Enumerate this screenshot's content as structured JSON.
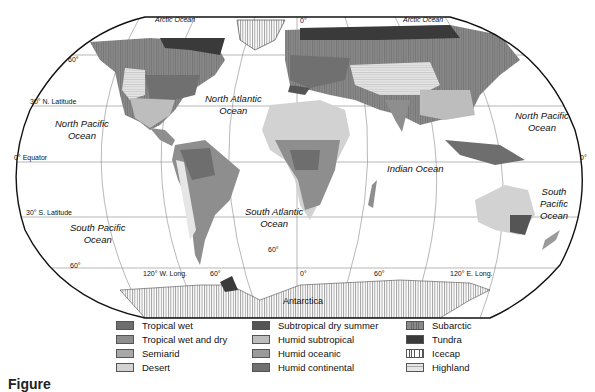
{
  "map": {
    "title": "World climate regions",
    "oceans": [
      {
        "name": "Arctic Ocean",
        "key": "arctic_w"
      },
      {
        "name": "Arctic Ocean",
        "key": "arctic_e"
      },
      {
        "line1": "North Pacific",
        "line2": "Ocean",
        "key": "npac_w"
      },
      {
        "line1": "North Atlantic",
        "line2": "Ocean",
        "key": "natl"
      },
      {
        "line1": "North Pacific",
        "line2": "Ocean",
        "key": "npac_e"
      },
      {
        "name": "Indian Ocean",
        "key": "indian"
      },
      {
        "line1": "South Atlantic",
        "line2": "Ocean",
        "key": "satl"
      },
      {
        "line1": "South Pacific",
        "line2": "Ocean",
        "key": "spac_w"
      },
      {
        "line1": "South",
        "line2": "Pacific",
        "line3": "Ocean",
        "key": "spac_e"
      }
    ],
    "continent_labels": {
      "antarctica": "Antarctica"
    },
    "graticule_labels": {
      "lat_60_n": "60°",
      "lat_30_n": "30° N. Latitude",
      "equator": "0° Equator",
      "equator_right": "0°",
      "lat_30_s": "30° S. Latitude",
      "lat_60_s": "60°",
      "lat_60_s_mid": "60°",
      "lon_0_top": "0°",
      "lon_120w": "120° W. Long.",
      "lon_60w": "60°",
      "lon_0": "0°",
      "lon_60e": "60°",
      "lon_120e": "120° E. Long."
    }
  },
  "legend": {
    "columns": [
      [
        {
          "label": "Tropical wet",
          "color": "#6e6e6e",
          "pattern": "solid"
        },
        {
          "label": "Tropical wet and dry",
          "color": "#8e8e8e",
          "pattern": "solid"
        },
        {
          "label": "Semiarid",
          "color": "#a8a8a8",
          "pattern": "dots"
        },
        {
          "label": "Desert",
          "color": "#d2d2d2",
          "pattern": "solid"
        }
      ],
      [
        {
          "label": "Subtropical dry summer",
          "color": "#555555",
          "pattern": "solid"
        },
        {
          "label": "Humid subtropical",
          "color": "#bdbdbd",
          "pattern": "solid"
        },
        {
          "label": "Humid oceanic",
          "color": "#9a9a9a",
          "pattern": "solid"
        },
        {
          "label": "Humid continental",
          "color": "#707070",
          "pattern": "solid"
        }
      ],
      [
        {
          "label": "Subarctic",
          "color": "#8a8a8a",
          "pattern": "vlines"
        },
        {
          "label": "Tundra",
          "color": "#3a3a3a",
          "pattern": "solid"
        },
        {
          "label": "Icecap",
          "color": "#ffffff",
          "pattern": "vlines"
        },
        {
          "label": "Highland",
          "color": "#e6e6e6",
          "pattern": "hlines"
        }
      ]
    ]
  },
  "caption": "Figure"
}
